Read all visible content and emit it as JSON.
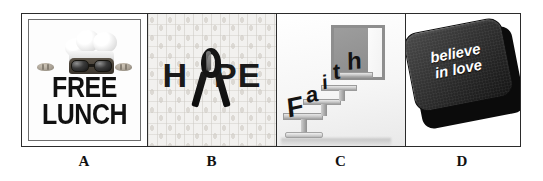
{
  "figure": {
    "panel_count": 4,
    "border_color": "#2b2b2b",
    "background_color": "#ffffff"
  },
  "panels": [
    {
      "label": "A",
      "name": "free-lunch-poster",
      "text_line1": "FREE",
      "text_line2": "LUNCH",
      "imagery": "chef wearing a toque and dark sunglasses peeking over the text, bread rolls on either side",
      "text_color": "#111111",
      "background_color": "#fdfdfd"
    },
    {
      "label": "B",
      "name": "hope-ribbon-graphic",
      "word_left": "H",
      "word_right": "PE",
      "full_word": "HOPE",
      "imagery": "awareness ribbon replacing the letter O, over a tiled ribbon-pattern background",
      "text_color": "#1a1a1a",
      "background_color": "#f2f1ef"
    },
    {
      "label": "C",
      "name": "faith-steps-graphic",
      "word": "Faith",
      "letters": [
        "F",
        "a",
        "i",
        "t",
        "h"
      ],
      "imagery": "three-dimensional letters standing on ascending steps leading toward an open doorway",
      "text_color": "#131313",
      "background_color": "#f6f6f6"
    },
    {
      "label": "D",
      "name": "believe-in-love-key",
      "text_line1": "believe",
      "text_line2": "in love",
      "imagery": "tilted dark computer keyboard key with white italic lettering",
      "text_color": "#ffffff",
      "background_color": "#242424"
    }
  ]
}
